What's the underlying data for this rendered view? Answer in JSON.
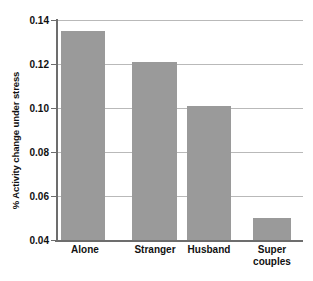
{
  "chart_data": {
    "type": "bar",
    "title": "",
    "xlabel": "",
    "ylabel": "% Activity change under stress",
    "categories": [
      "Alone",
      "Stranger",
      "Husband",
      "Super couples"
    ],
    "category_lines": [
      [
        "Alone"
      ],
      [
        "Stranger"
      ],
      [
        "Husband"
      ],
      [
        "Super",
        "couples"
      ]
    ],
    "values": [
      0.135,
      0.121,
      0.101,
      0.05
    ],
    "ylim": [
      0.04,
      0.14
    ],
    "ytick_labels": [
      "0.04",
      "0.06",
      "0.08",
      "0.10",
      "0.12",
      "0.14"
    ],
    "ytick_values": [
      0.04,
      0.06,
      0.08,
      0.1,
      0.12,
      0.14
    ],
    "grid": "horizontal",
    "legend": "none",
    "bar_color": "#9a9a9a",
    "gridline_color": "#b9b9b9",
    "axis_color": "#6d6d6d",
    "text_color": "#111111",
    "background": "#ffffff"
  }
}
